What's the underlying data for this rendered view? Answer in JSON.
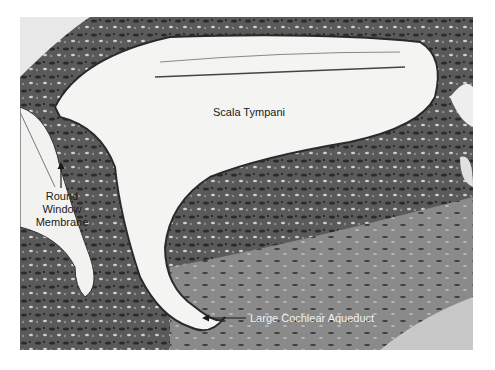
{
  "figure": {
    "type": "histology micrograph (grayscale)",
    "labels": {
      "scala_tympani": "Scala Tympani",
      "round_window_membrane": [
        "Round",
        "Window",
        "Membrane"
      ],
      "large_cochlear_aqueduct": "Large Cochlear Aqueduct"
    },
    "colors": {
      "background": "#ffffff",
      "tissue_dark": "#2a2a2a",
      "tissue_mid": "#7a7a7a",
      "lumen": "#f4f4f2",
      "label_dark": "#1a1a1a",
      "label_light": "#f2f2f2"
    }
  }
}
